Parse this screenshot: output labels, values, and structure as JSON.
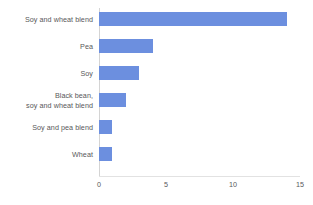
{
  "chart_data": {
    "type": "bar",
    "orientation": "horizontal",
    "title": "",
    "xlabel": "",
    "ylabel": "",
    "xlim": [
      0,
      15
    ],
    "xticks": [
      0,
      5,
      10,
      15
    ],
    "xtick_labels": [
      "0",
      "5",
      "10",
      "15"
    ],
    "grid": false,
    "legend": null,
    "bar_color": "#6c8fdf",
    "label_color": "#58585a",
    "axis_color": "#d4d4d4",
    "background": "#ffffff",
    "categories": [
      "Soy and wheat blend",
      "Pea",
      "Soy",
      "Black bean, soy and wheat blend",
      "Soy and pea blend",
      "Wheat"
    ],
    "category_lines": [
      [
        "Soy and wheat blend"
      ],
      [
        "Pea"
      ],
      [
        "Soy"
      ],
      [
        "Black bean,",
        "soy and wheat blend"
      ],
      [
        "Soy and pea blend"
      ],
      [
        "Wheat"
      ]
    ],
    "values": [
      14,
      4,
      3,
      2,
      1,
      1
    ]
  }
}
